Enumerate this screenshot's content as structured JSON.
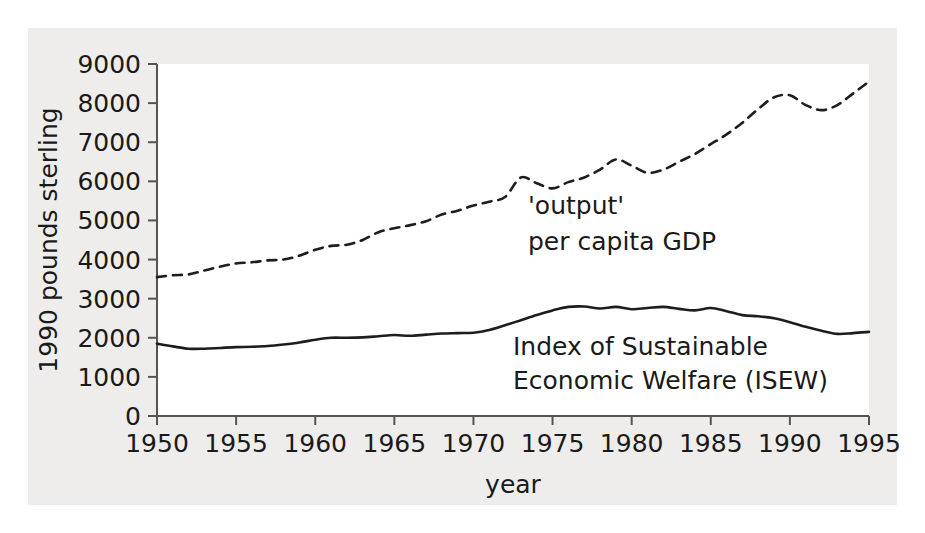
{
  "figure": {
    "background_color": "#eeedeb",
    "panel_color": "#ffffff",
    "ink_color": "#1d1d1d"
  },
  "chart_data": {
    "type": "line",
    "title": "",
    "subtitle": "",
    "xlabel": "year",
    "ylabel": "1990 pounds sterling",
    "xlim": [
      1950,
      1995
    ],
    "ylim": [
      0,
      9000
    ],
    "grid": false,
    "legend_position": "inline-annotation",
    "xticks": [
      1950,
      1955,
      1960,
      1965,
      1970,
      1975,
      1980,
      1985,
      1990,
      1995
    ],
    "yticks": [
      0,
      1000,
      2000,
      3000,
      4000,
      5000,
      6000,
      7000,
      8000,
      9000
    ],
    "x": [
      1950,
      1951,
      1952,
      1953,
      1954,
      1955,
      1956,
      1957,
      1958,
      1959,
      1960,
      1961,
      1962,
      1963,
      1964,
      1965,
      1966,
      1967,
      1968,
      1969,
      1970,
      1971,
      1972,
      1973,
      1974,
      1975,
      1976,
      1977,
      1978,
      1979,
      1980,
      1981,
      1982,
      1983,
      1984,
      1985,
      1986,
      1987,
      1988,
      1989,
      1990,
      1991,
      1992,
      1993,
      1994,
      1995
    ],
    "series": [
      {
        "name": "'output' per capita GDP",
        "style": "dashed",
        "annotation_lines": [
          "'output'",
          "per capita GDP"
        ],
        "values": [
          3550,
          3600,
          3620,
          3720,
          3820,
          3900,
          3930,
          3980,
          4000,
          4100,
          4250,
          4350,
          4380,
          4500,
          4700,
          4800,
          4880,
          4980,
          5150,
          5250,
          5380,
          5480,
          5600,
          6100,
          5950,
          5820,
          5980,
          6100,
          6300,
          6560,
          6400,
          6220,
          6300,
          6500,
          6700,
          6950,
          7200,
          7500,
          7850,
          8150,
          8200,
          7950,
          7820,
          7950,
          8250,
          8550
        ]
      },
      {
        "name": "Index of Sustainable Economic Welfare (ISEW)",
        "style": "solid",
        "annotation_lines": [
          "Index of Sustainable",
          "Economic Welfare (ISEW)"
        ],
        "values": [
          1850,
          1780,
          1720,
          1720,
          1740,
          1760,
          1770,
          1790,
          1830,
          1880,
          1950,
          2000,
          2000,
          2010,
          2040,
          2070,
          2050,
          2080,
          2110,
          2120,
          2130,
          2200,
          2320,
          2450,
          2580,
          2700,
          2790,
          2800,
          2750,
          2790,
          2730,
          2760,
          2790,
          2740,
          2700,
          2760,
          2680,
          2580,
          2550,
          2500,
          2400,
          2280,
          2180,
          2100,
          2120,
          2150
        ]
      }
    ],
    "annotations": [
      {
        "id": "gdp-label",
        "lines": [
          "'output'",
          "per capita GDP"
        ],
        "x_px": 528,
        "y_px": 214
      },
      {
        "id": "isew-label",
        "lines": [
          "Index of Sustainable",
          "Economic Welfare (ISEW)"
        ],
        "x_px": 513,
        "y_px": 355
      }
    ]
  }
}
